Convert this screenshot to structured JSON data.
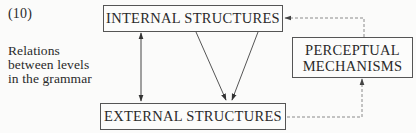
{
  "figure": {
    "number": "(10)",
    "caption_lines": [
      "Relations",
      "between levels",
      "in the grammar"
    ]
  },
  "nodes": {
    "internal": {
      "label": "INTERNAL STRUCTURES"
    },
    "external": {
      "label": "EXTERNAL STRUCTURES"
    },
    "perceptual": {
      "line1": "PERCEPTUAL",
      "line2": "MECHANISMS"
    }
  },
  "edges": [
    {
      "from": "internal",
      "to": "external",
      "style": "solid",
      "direction": "bidirectional"
    },
    {
      "from": "internal",
      "to": "external",
      "style": "solid",
      "direction": "forward"
    },
    {
      "from": "internal",
      "to": "external",
      "style": "solid",
      "direction": "forward"
    },
    {
      "from": "perceptual",
      "to": "internal",
      "style": "dashed",
      "direction": "forward"
    },
    {
      "from": "external",
      "to": "perceptual",
      "style": "dashed",
      "direction": "forward"
    }
  ],
  "colors": {
    "line": "#444444",
    "dashed_line": "#8a8a8a",
    "text": "#2a2a2a",
    "background": "#fbfbfa"
  }
}
